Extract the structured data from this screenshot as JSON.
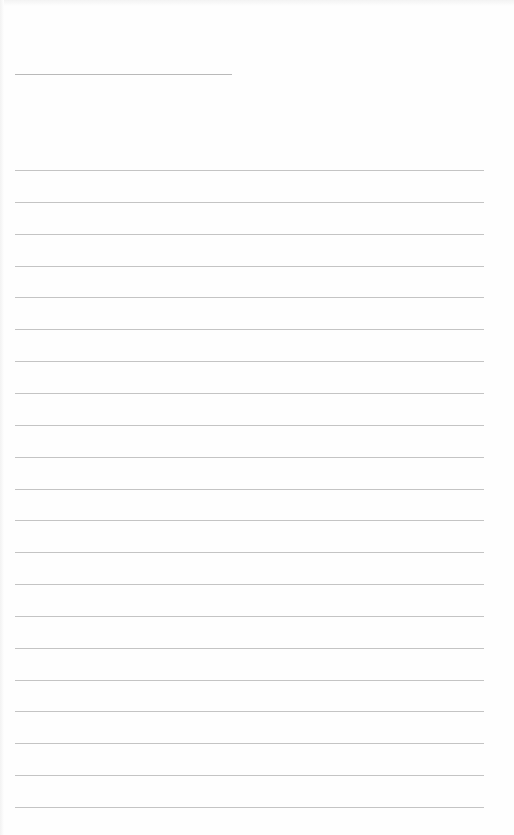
{
  "page": {
    "type": "blank-lined-sheet",
    "background_color": "#fefefe",
    "line_color": "#c4c4c4",
    "title_line": {
      "x": 15,
      "y": 74,
      "width": 217
    },
    "ruled_lines": {
      "count": 21,
      "x": 15,
      "width": 469,
      "first_y": 170,
      "spacing": 31.85
    }
  }
}
